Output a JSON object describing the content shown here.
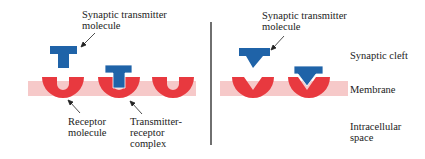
{
  "left_panel": {
    "transmitter_label": "Synaptic transmitter\nmolecule",
    "receptor_label": "Receptor\nmolecule",
    "complex_label": "Transmitter-\nreceptor\ncomplex"
  },
  "right_panel": {
    "transmitter_label": "Synaptic transmitter\nmolecule"
  },
  "region_labels": {
    "cleft": "Synaptic cleft",
    "membrane": "Membrane",
    "intracellular": "Intracellular\nspace"
  },
  "colors": {
    "transmitter": "#1f63a8",
    "receptor": "#e8393f",
    "membrane": "#f6c9c9",
    "divider": "#222222"
  }
}
